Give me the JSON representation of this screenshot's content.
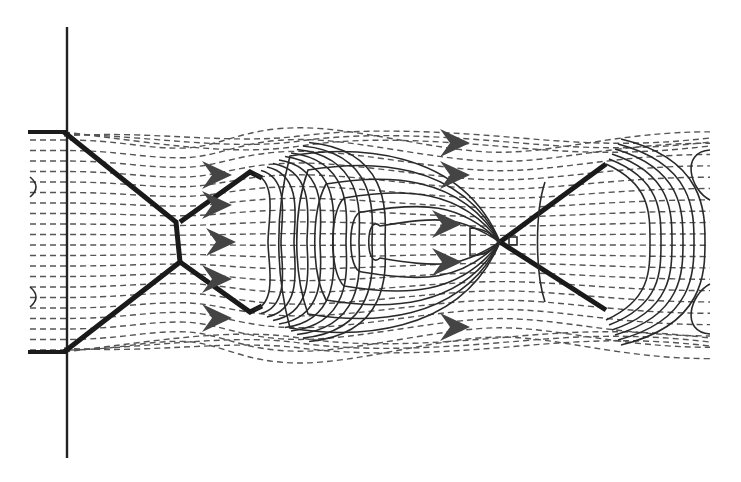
{
  "figure": {
    "type": "underexpanded-jet-flow-schematic",
    "colors": {
      "background": "#ffffff",
      "lines": "#2a2a2a",
      "dashed_streamlines": "#555555",
      "arrows": "#444444"
    },
    "elements": {
      "wall": {
        "x": 67,
        "y_top": 27,
        "y_bottom": 458
      },
      "nozzle_lips": [
        {
          "x1": 28,
          "x2": 67,
          "y": 132
        },
        {
          "x1": 28,
          "x2": 67,
          "y": 352
        }
      ],
      "mach_disk": {
        "x": 180,
        "y_top": 222,
        "y_bottom": 262
      },
      "first_shock_cell": {
        "x_start": 180,
        "x_end": 262
      },
      "shock_crossing": {
        "x": 500,
        "y": 242
      },
      "second_shock_cell": {
        "x_start": 500,
        "x_end": 612
      },
      "flow_arrows_count": 10
    }
  }
}
